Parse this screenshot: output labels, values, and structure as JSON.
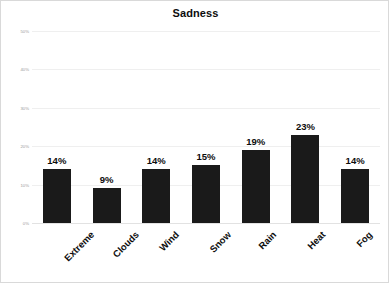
{
  "chart_data": {
    "type": "bar",
    "title": "Sadness",
    "xlabel": "",
    "ylabel": "",
    "categories": [
      "Extreme",
      "Clouds",
      "Wind",
      "Snow",
      "Rain",
      "Heat",
      "Fog"
    ],
    "values": [
      14,
      9,
      14,
      15,
      19,
      23,
      14
    ],
    "value_labels": [
      "14%",
      "9%",
      "14%",
      "15%",
      "19%",
      "23%",
      "14%"
    ],
    "ylim": [
      0,
      50
    ],
    "yticks": [
      0,
      10,
      20,
      30,
      40,
      50
    ],
    "ytick_labels": [
      "0%",
      "10%",
      "20%",
      "30%",
      "40%",
      "50%"
    ],
    "grid": true,
    "legend": false,
    "bar_color": "#1a1a1a",
    "gridline_color": "#efefef",
    "background_color": "#ffffff",
    "border_color": "#d9d9d9",
    "label_rotation": -45
  }
}
